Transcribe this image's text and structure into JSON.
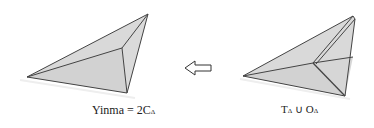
{
  "diagram": {
    "left_figure": {
      "label_main": "Yinma",
      "label_eq": " = 2C",
      "label_sub": "Δ",
      "fill": "#d6d6d6",
      "stroke": "#444444"
    },
    "arrow": {
      "direction": "left",
      "glyph": "⇦"
    },
    "right_figure": {
      "label_t": "T",
      "label_t_sub": "Δ",
      "label_union": " ∪ ",
      "label_o": "O",
      "label_o_sub": "Δ",
      "fill": "#d6d6d6",
      "stroke": "#444444"
    }
  }
}
